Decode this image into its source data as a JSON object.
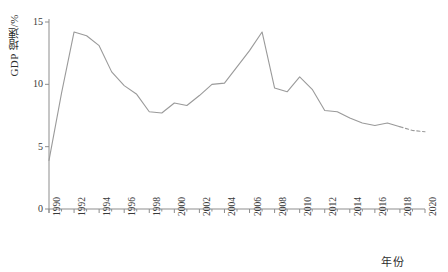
{
  "chart_data": {
    "type": "line",
    "title": "",
    "xlabel": "年份",
    "ylabel": "GDP 增速/%",
    "xlim": [
      1990,
      2020
    ],
    "ylim": [
      0,
      15
    ],
    "grid": false,
    "legend": "none",
    "y_ticks": [
      0,
      5,
      10,
      15
    ],
    "y_tick_labels": [
      "0",
      "5",
      "10",
      "15"
    ],
    "x_ticks": [
      1990,
      1992,
      1994,
      1996,
      1998,
      2000,
      2002,
      2004,
      2006,
      2008,
      2010,
      2012,
      2014,
      2016,
      2018,
      2020
    ],
    "x_tick_labels": [
      "1990",
      "1992",
      "1994",
      "1996",
      "1998",
      "2000",
      "2002",
      "2004",
      "2006",
      "2008",
      "2010",
      "2012",
      "2014",
      "2016",
      "2018",
      "2020"
    ],
    "x_minor_ticks": [
      1991,
      1993,
      1995,
      1997,
      1999,
      2001,
      2003,
      2005,
      2007,
      2009,
      2011,
      2013,
      2015,
      2017,
      2019
    ],
    "line_color": "#9a9a9a",
    "axis_color": "#8d8d8d",
    "series": [
      {
        "name": "GDP 增速",
        "style": "solid",
        "x": [
          1990,
          1991,
          1992,
          1993,
          1994,
          1995,
          1996,
          1997,
          1998,
          1999,
          2000,
          2001,
          2002,
          2003,
          2004,
          2005,
          2006,
          2007,
          2008,
          2009,
          2010,
          2011,
          2012,
          2013,
          2014,
          2015,
          2016,
          2017,
          2018
        ],
        "values": [
          3.9,
          9.3,
          14.2,
          13.9,
          13.1,
          11.0,
          9.9,
          9.2,
          7.8,
          7.7,
          8.5,
          8.3,
          9.1,
          10.0,
          10.1,
          11.4,
          12.7,
          14.2,
          9.7,
          9.4,
          10.6,
          9.6,
          7.9,
          7.8,
          7.3,
          6.9,
          6.7,
          6.9,
          6.6
        ]
      },
      {
        "name": "GDP 增速（预测）",
        "style": "dashed",
        "x": [
          2018,
          2019,
          2020
        ],
        "values": [
          6.6,
          6.3,
          6.2
        ]
      }
    ]
  }
}
